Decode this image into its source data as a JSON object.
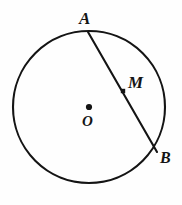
{
  "figure": {
    "background_color": "#fefefe",
    "stroke_color": "#141414",
    "canvas": {
      "width": 182,
      "height": 205
    },
    "circle": {
      "name": "main-circle",
      "center_x": 89,
      "center_y": 107,
      "radius": 76,
      "stroke_width": 2.1,
      "fill": "none"
    },
    "chord": {
      "name": "chord-AB",
      "x1": 88,
      "y1": 32,
      "x2": 157,
      "y2": 152,
      "stroke_width": 2.1
    },
    "points": [
      {
        "id": "A",
        "label": "A",
        "x": 88,
        "y": 32,
        "marker": "none",
        "label_x": 85,
        "label_y": 18
      },
      {
        "id": "M",
        "label": "M",
        "x": 123,
        "y": 91,
        "marker": "square",
        "marker_size": 4.4,
        "label_x": 136,
        "label_y": 82
      },
      {
        "id": "B",
        "label": "B",
        "x": 157,
        "y": 152,
        "marker": "none",
        "label_x": 165,
        "label_y": 158
      },
      {
        "id": "O",
        "label": "O",
        "x": 89,
        "y": 107,
        "marker": "dot",
        "marker_size": 3.1,
        "label_x": 89,
        "label_y": 122
      }
    ]
  }
}
